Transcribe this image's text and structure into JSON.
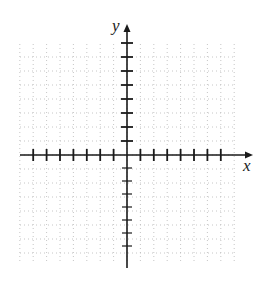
{
  "diagram": {
    "type": "coordinate-plane",
    "axes": {
      "x": {
        "label": "x",
        "ticks_negative": 7,
        "ticks_positive": 7,
        "tick_spacing_px": 13.4
      },
      "y": {
        "label": "y",
        "ticks_positive": 8,
        "ticks_negative": 7,
        "tick_spacing_px_upper": 14,
        "tick_spacing_px_lower": 13
      }
    },
    "origin_px": {
      "x": 127,
      "y": 155
    },
    "x_axis_extent_px": {
      "left": 20,
      "right": 253
    },
    "y_axis_extent_px": {
      "top": 24,
      "bottom": 268
    },
    "grid": {
      "style": "dotted",
      "visible": true,
      "extent_px": {
        "left": 20,
        "right": 234,
        "top": 44,
        "bottom": 262
      }
    },
    "colors": {
      "axis": "#1a1a1a",
      "tick": "#1a1a1a",
      "grid": "#b8b8b8",
      "label": "#222222",
      "background": "#ffffff"
    }
  }
}
